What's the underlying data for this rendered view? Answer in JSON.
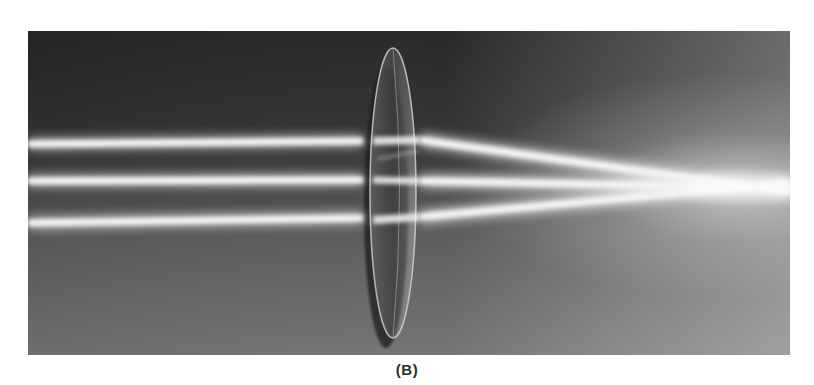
{
  "figure": {
    "caption": "(B)",
    "colors": {
      "background_dark": "#2b2b2b",
      "background_mid": "#5a5a5a",
      "background_light": "#9a9a9a",
      "beam": "#f4f4f4",
      "lens_edge": "#d8d8d8",
      "page": "#ffffff"
    },
    "beams": [
      {
        "name": "top",
        "entry_y": 144,
        "lens_y": 141
      },
      {
        "name": "middle",
        "entry_y": 181,
        "lens_y": 180
      },
      {
        "name": "bottom",
        "entry_y": 223,
        "lens_y": 218
      }
    ],
    "focal_point": {
      "x": 720,
      "y": 187
    },
    "lens": {
      "center_x": 393,
      "top_y": 48,
      "bottom_y": 333,
      "width": 46
    }
  }
}
